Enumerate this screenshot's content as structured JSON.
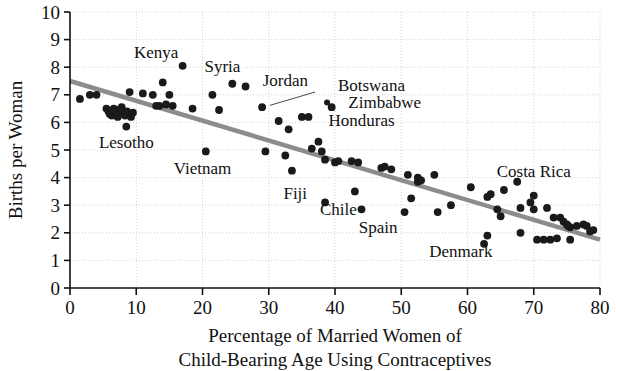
{
  "chart_data": {
    "type": "scatter",
    "title": "",
    "xlabel": "Percentage of Married Women of Child-Bearing Age Using Contraceptives",
    "xlabel_line1": "Percentage of Married Women of",
    "xlabel_line2": "Child-Bearing Age Using Contraceptives",
    "ylabel": "Births per Woman",
    "xlim": [
      0,
      80
    ],
    "ylim": [
      0,
      10
    ],
    "xticks": [
      0,
      10,
      20,
      30,
      40,
      50,
      60,
      70,
      80
    ],
    "yticks": [
      0,
      1,
      2,
      3,
      4,
      5,
      6,
      7,
      8,
      9,
      10
    ],
    "grid": true,
    "grid_style": "dotted",
    "legend": "none",
    "point_color": "#1a1a1a",
    "trend_color": "#8c8c8c",
    "trendline": {
      "type": "linear",
      "x_start": 0,
      "y_start": 7.5,
      "x_end": 80,
      "y_end": 1.75,
      "slope": -0.0719,
      "intercept": 7.5
    },
    "points": [
      {
        "x": 1.5,
        "y": 6.85
      },
      {
        "x": 3.0,
        "y": 7.0
      },
      {
        "x": 4.0,
        "y": 7.0
      },
      {
        "x": 5.5,
        "y": 6.5
      },
      {
        "x": 5.8,
        "y": 6.4
      },
      {
        "x": 6.0,
        "y": 6.3
      },
      {
        "x": 6.3,
        "y": 6.25
      },
      {
        "x": 6.6,
        "y": 6.5
      },
      {
        "x": 7.0,
        "y": 6.45
      },
      {
        "x": 7.2,
        "y": 6.2
      },
      {
        "x": 7.5,
        "y": 6.35
      },
      {
        "x": 7.8,
        "y": 6.55
      },
      {
        "x": 8.0,
        "y": 6.3
      },
      {
        "x": 8.3,
        "y": 6.25
      },
      {
        "x": 8.6,
        "y": 6.4
      },
      {
        "x": 9.0,
        "y": 7.1
      },
      {
        "x": 9.2,
        "y": 6.2
      },
      {
        "x": 9.5,
        "y": 6.35
      },
      {
        "x": 8.5,
        "y": 5.85
      },
      {
        "x": 11.0,
        "y": 7.05
      },
      {
        "x": 12.5,
        "y": 7.0
      },
      {
        "x": 13.0,
        "y": 6.6
      },
      {
        "x": 13.5,
        "y": 6.6
      },
      {
        "x": 14.0,
        "y": 7.45
      },
      {
        "x": 14.5,
        "y": 6.65
      },
      {
        "x": 15.0,
        "y": 7.0
      },
      {
        "x": 15.5,
        "y": 6.6
      },
      {
        "x": 17.0,
        "y": 8.05
      },
      {
        "x": 18.5,
        "y": 6.5
      },
      {
        "x": 20.5,
        "y": 4.95
      },
      {
        "x": 21.5,
        "y": 7.0
      },
      {
        "x": 22.5,
        "y": 6.45
      },
      {
        "x": 24.5,
        "y": 7.4
      },
      {
        "x": 26.5,
        "y": 7.3
      },
      {
        "x": 29.0,
        "y": 6.55
      },
      {
        "x": 29.5,
        "y": 4.95
      },
      {
        "x": 31.5,
        "y": 6.05
      },
      {
        "x": 32.5,
        "y": 4.8
      },
      {
        "x": 33.0,
        "y": 5.75
      },
      {
        "x": 33.5,
        "y": 4.25
      },
      {
        "x": 35.0,
        "y": 6.2
      },
      {
        "x": 36.0,
        "y": 6.2
      },
      {
        "x": 36.5,
        "y": 5.05
      },
      {
        "x": 37.5,
        "y": 5.3
      },
      {
        "x": 38.0,
        "y": 4.95
      },
      {
        "x": 38.5,
        "y": 4.65
      },
      {
        "x": 38.5,
        "y": 3.1
      },
      {
        "x": 39.5,
        "y": 6.55
      },
      {
        "x": 40.0,
        "y": 4.55
      },
      {
        "x": 40.5,
        "y": 4.6
      },
      {
        "x": 42.5,
        "y": 4.6
      },
      {
        "x": 43.5,
        "y": 4.55
      },
      {
        "x": 43.0,
        "y": 3.5
      },
      {
        "x": 44.0,
        "y": 2.85
      },
      {
        "x": 47.0,
        "y": 4.35
      },
      {
        "x": 47.5,
        "y": 4.4
      },
      {
        "x": 48.5,
        "y": 4.3
      },
      {
        "x": 50.5,
        "y": 2.75
      },
      {
        "x": 51.0,
        "y": 4.1
      },
      {
        "x": 51.5,
        "y": 3.25
      },
      {
        "x": 52.5,
        "y": 4.0
      },
      {
        "x": 52.5,
        "y": 3.85
      },
      {
        "x": 53.0,
        "y": 3.9
      },
      {
        "x": 55.0,
        "y": 4.1
      },
      {
        "x": 55.5,
        "y": 2.75
      },
      {
        "x": 57.5,
        "y": 3.0
      },
      {
        "x": 60.5,
        "y": 3.65
      },
      {
        "x": 62.5,
        "y": 1.6
      },
      {
        "x": 63.0,
        "y": 3.3
      },
      {
        "x": 63.5,
        "y": 3.4
      },
      {
        "x": 63.0,
        "y": 1.9
      },
      {
        "x": 64.5,
        "y": 2.85
      },
      {
        "x": 65.5,
        "y": 3.55
      },
      {
        "x": 65.0,
        "y": 2.6
      },
      {
        "x": 67.5,
        "y": 3.85
      },
      {
        "x": 68.0,
        "y": 2.9
      },
      {
        "x": 68.0,
        "y": 2.0
      },
      {
        "x": 69.5,
        "y": 3.1
      },
      {
        "x": 70.0,
        "y": 3.35
      },
      {
        "x": 70.0,
        "y": 2.85
      },
      {
        "x": 70.5,
        "y": 1.75
      },
      {
        "x": 71.5,
        "y": 1.75
      },
      {
        "x": 72.0,
        "y": 2.9
      },
      {
        "x": 72.5,
        "y": 1.75
      },
      {
        "x": 73.0,
        "y": 2.55
      },
      {
        "x": 73.5,
        "y": 1.8
      },
      {
        "x": 74.0,
        "y": 2.55
      },
      {
        "x": 74.5,
        "y": 2.4
      },
      {
        "x": 75.0,
        "y": 2.3
      },
      {
        "x": 75.2,
        "y": 2.25
      },
      {
        "x": 75.5,
        "y": 2.2
      },
      {
        "x": 75.5,
        "y": 1.75
      },
      {
        "x": 76.5,
        "y": 2.25
      },
      {
        "x": 77.5,
        "y": 2.3
      },
      {
        "x": 78.0,
        "y": 2.25
      },
      {
        "x": 78.5,
        "y": 2.05
      },
      {
        "x": 79.0,
        "y": 2.1
      }
    ],
    "annotations": [
      {
        "label": "Kenya",
        "x": 13.0,
        "y": 8.55,
        "anchor": "middle",
        "leader": false
      },
      {
        "label": "Syria",
        "x": 23.0,
        "y": 8.05,
        "anchor": "middle",
        "leader": false
      },
      {
        "label": "Jordan",
        "x": 32.5,
        "y": 7.55,
        "anchor": "middle",
        "leader": false
      },
      {
        "label": "Botswana",
        "x": 45.5,
        "y": 7.35,
        "anchor": "middle",
        "leader": true,
        "leader_from_x": 37.0,
        "leader_from_y": 7.1,
        "leader_to_x": 30.2,
        "leader_to_y": 6.62
      },
      {
        "label": "Zimbabwe",
        "x": 47.5,
        "y": 6.75,
        "anchor": "middle",
        "leader": false,
        "bullet": true,
        "bullet_x": 38.8,
        "bullet_y": 6.72
      },
      {
        "label": "Honduras",
        "x": 44.0,
        "y": 6.1,
        "anchor": "middle",
        "leader": false
      },
      {
        "label": "Lesotho",
        "x": 8.5,
        "y": 5.3,
        "anchor": "middle",
        "leader": false
      },
      {
        "label": "Vietnam",
        "x": 20.0,
        "y": 4.35,
        "anchor": "middle",
        "leader": false
      },
      {
        "label": "Costa Rica",
        "x": 70.0,
        "y": 4.25,
        "anchor": "middle",
        "leader": false
      },
      {
        "label": "Fiji",
        "x": 34.0,
        "y": 3.45,
        "anchor": "middle",
        "leader": false
      },
      {
        "label": "Chile",
        "x": 40.5,
        "y": 2.85,
        "anchor": "middle",
        "leader": false
      },
      {
        "label": "Spain",
        "x": 46.5,
        "y": 2.2,
        "anchor": "middle",
        "leader": false
      },
      {
        "label": "Denmark",
        "x": 59.0,
        "y": 1.35,
        "anchor": "middle",
        "leader": false
      }
    ]
  }
}
